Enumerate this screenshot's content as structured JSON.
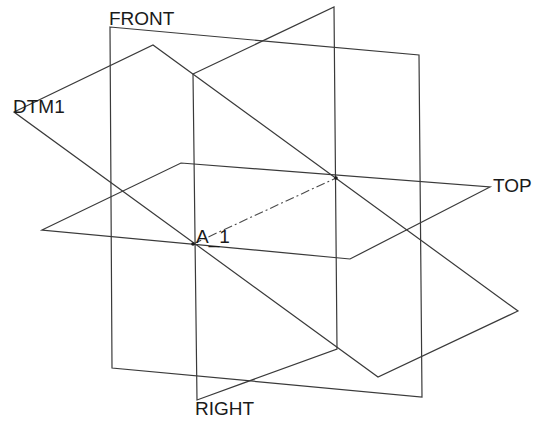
{
  "diagram": {
    "type": "cad-datum-planes-isometric",
    "background": "#ffffff",
    "line_color": "#3a3a3a",
    "planes": [
      {
        "name": "FRONT",
        "points": "110,27 419,55 422,397 112,368"
      },
      {
        "name": "RIGHT",
        "points": "193,74 334,7 337,349 197,400"
      },
      {
        "name": "TOP",
        "points": "42,230 181,163 490,187 350,259"
      },
      {
        "name": "DTM1",
        "points": "14,112 153,45 518,311 378,377"
      }
    ],
    "axes": [
      {
        "name": "A_1",
        "x1": 193,
        "y1": 244,
        "x2": 336,
        "y2": 178
      }
    ],
    "labels": {
      "front": "FRONT",
      "right": "RIGHT",
      "top": "TOP",
      "dtm1": "DTM1",
      "axis": "A_1"
    }
  }
}
